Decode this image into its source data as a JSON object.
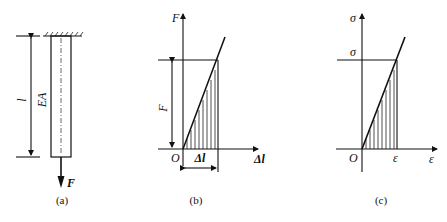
{
  "figures": [
    {
      "id": "a",
      "caption": "(a)",
      "description": "Bar fixed at top, length l, axial rigidity EA, loaded by tensile force F at bottom",
      "labels": {
        "length": "l",
        "rigidity": "EA",
        "force": "F"
      }
    },
    {
      "id": "b",
      "caption": "(b)",
      "description": "Force-elongation diagram, linear, shaded triangular area",
      "labels": {
        "y_axis": "F",
        "x_axis": "Δl",
        "origin": "O",
        "y_value": "F",
        "x_value": "Δl"
      }
    },
    {
      "id": "c",
      "caption": "(c)",
      "description": "Stress-strain diagram, linear, shaded triangular area",
      "labels": {
        "y_axis": "σ",
        "x_axis": "ε",
        "origin": "O",
        "y_value": "σ",
        "x_value": "ε"
      }
    }
  ],
  "colors": {
    "ink": "#111111",
    "background": "#ffffff"
  }
}
